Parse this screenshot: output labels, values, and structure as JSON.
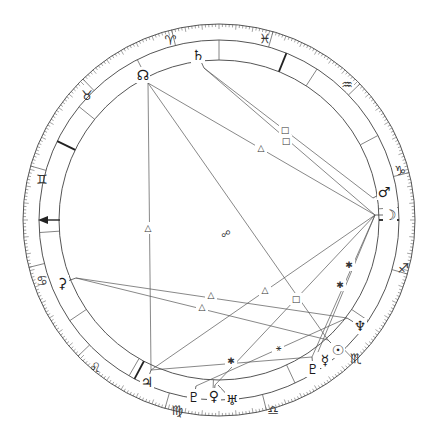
{
  "chart": {
    "type": "astrological-natal-wheel",
    "center": [
      219,
      220
    ],
    "radii": {
      "outer": 196,
      "zodiac_inner": 180,
      "house_inner": 160,
      "planet": 170
    },
    "colors": {
      "line": "#555555",
      "glyph": "#222222",
      "background": "#ffffff"
    }
  },
  "signs": [
    {
      "name": "aries",
      "glyph": "♈",
      "x": 170,
      "y": 40
    },
    {
      "name": "pisces",
      "glyph": "♓",
      "x": 265,
      "y": 38
    },
    {
      "name": "aquarius",
      "glyph": "♒",
      "x": 347,
      "y": 84
    },
    {
      "name": "capricorn",
      "glyph": "♑",
      "x": 400,
      "y": 170
    },
    {
      "name": "sagittarius",
      "glyph": "♐",
      "x": 403,
      "y": 268
    },
    {
      "name": "scorpio",
      "glyph": "♏",
      "x": 356,
      "y": 358
    },
    {
      "name": "libra",
      "glyph": "♎",
      "x": 273,
      "y": 410
    },
    {
      "name": "virgo",
      "glyph": "♍",
      "x": 177,
      "y": 410
    },
    {
      "name": "leo",
      "glyph": "♌",
      "x": 95,
      "y": 367
    },
    {
      "name": "cancer",
      "glyph": "♋",
      "x": 42,
      "y": 280
    },
    {
      "name": "gemini",
      "glyph": "♊",
      "x": 42,
      "y": 179
    },
    {
      "name": "taurus",
      "glyph": "♉",
      "x": 87,
      "y": 95
    }
  ],
  "planets": [
    {
      "name": "north-node",
      "glyph": "☊",
      "x": 143,
      "y": 75,
      "anchor": [
        148,
        83
      ]
    },
    {
      "name": "saturn",
      "glyph": "♄",
      "x": 198,
      "y": 55,
      "anchor": [
        204,
        68
      ]
    },
    {
      "name": "mars",
      "glyph": "♂",
      "x": 384,
      "y": 192,
      "anchor": [
        373,
        198
      ]
    },
    {
      "name": "moon",
      "glyph": "☽",
      "x": 390,
      "y": 215,
      "anchor": [
        375,
        215
      ]
    },
    {
      "name": "neptune",
      "glyph": "♆",
      "x": 360,
      "y": 326,
      "anchor": [
        347,
        318
      ]
    },
    {
      "name": "sun",
      "glyph": "☉",
      "x": 338,
      "y": 350,
      "anchor": [
        328,
        340
      ]
    },
    {
      "name": "mercury",
      "glyph": "☿",
      "x": 325,
      "y": 360,
      "anchor": [
        318,
        352
      ]
    },
    {
      "name": "pluto-alt",
      "glyph": "♇",
      "x": 313,
      "y": 369,
      "anchor": [
        312,
        357
      ]
    },
    {
      "name": "uranus",
      "glyph": "♅",
      "x": 232,
      "y": 400,
      "anchor": [
        218,
        385
      ]
    },
    {
      "name": "venus",
      "glyph": "♀",
      "x": 214,
      "y": 396,
      "anchor": [
        215,
        385
      ]
    },
    {
      "name": "pluto",
      "glyph": "♇",
      "x": 194,
      "y": 397,
      "anchor": [
        196,
        386
      ]
    },
    {
      "name": "jupiter",
      "glyph": "♃",
      "x": 147,
      "y": 382,
      "anchor": [
        151,
        370
      ]
    },
    {
      "name": "ceres",
      "glyph": "⚳",
      "x": 62,
      "y": 283,
      "anchor": [
        76,
        278
      ]
    }
  ],
  "house_cusps_deg": [
    4,
    28,
    57,
    90,
    117,
    141,
    184,
    214,
    240,
    268,
    295,
    326
  ],
  "angle_cusps_deg": [
    0,
    68,
    154,
    242
  ],
  "ascendant": {
    "label": "ASC",
    "glyph": "←",
    "x": 52,
    "y": 220
  },
  "aspects": [
    {
      "from": "north-node",
      "to": "jupiter",
      "type": "trine",
      "symbol": "△",
      "label_pos": [
        148,
        228
      ]
    },
    {
      "from": "north-node",
      "to": "sun",
      "type": "opposition",
      "symbol": "☍",
      "label_pos": [
        226,
        234
      ]
    },
    {
      "from": "north-node",
      "to": "moon",
      "type": "trine",
      "symbol": "△",
      "label_pos": [
        261,
        148
      ]
    },
    {
      "from": "saturn",
      "to": "mars",
      "type": "square",
      "symbol": "□",
      "label_pos": [
        285,
        130
      ]
    },
    {
      "from": "saturn",
      "to": "moon",
      "type": "square",
      "symbol": "□",
      "label_pos": [
        286,
        141
      ]
    },
    {
      "from": "ceres",
      "to": "neptune",
      "type": "trine",
      "symbol": "△",
      "label_pos": [
        211,
        295
      ]
    },
    {
      "from": "ceres",
      "to": "sun",
      "type": "trine",
      "symbol": "△",
      "label_pos": [
        202,
        307
      ]
    },
    {
      "from": "jupiter",
      "to": "moon",
      "type": "trine",
      "symbol": "△",
      "label_pos": [
        265,
        290
      ]
    },
    {
      "from": "moon",
      "to": "venus",
      "type": "square",
      "symbol": "□",
      "label_pos": [
        296,
        299
      ]
    },
    {
      "from": "moon",
      "to": "pluto-alt",
      "type": "sextile",
      "symbol": "✱",
      "label_pos": [
        349,
        265
      ]
    },
    {
      "from": "moon",
      "to": "mercury",
      "type": "sextile",
      "symbol": "✱",
      "label_pos": [
        340,
        285
      ]
    },
    {
      "from": "jupiter",
      "to": "pluto-alt",
      "type": "sextile",
      "symbol": "✱",
      "label_pos": [
        231,
        361
      ]
    },
    {
      "from": "pluto",
      "to": "neptune",
      "type": "semi-sextile",
      "symbol": "⚹",
      "label_pos": [
        278,
        348
      ]
    }
  ]
}
